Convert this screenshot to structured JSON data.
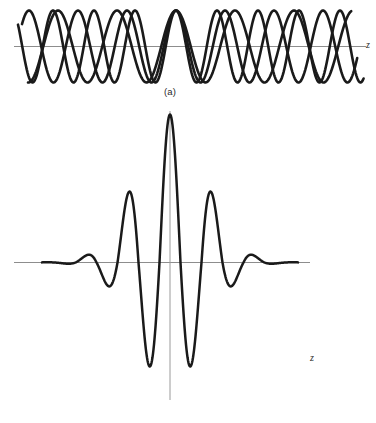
{
  "figure": {
    "background_color": "#ffffff",
    "curve_color": "#1a1a1a",
    "axis_color": "#8d8d8d",
    "width": 376,
    "height": 423
  },
  "panels": [
    {
      "id": "a",
      "caption": "(a)",
      "axis_label": "z",
      "description": "Three superposed sinusoidal waves of slightly different wavelengths that come into phase near the center",
      "axis_y": 46,
      "axis_x_start": 14,
      "axis_x_end": 366
    },
    {
      "id": "b",
      "caption": "(b)",
      "axis_label": "z",
      "description": "Resultant wave packet from the sum of the component waves, peaking where the components are in phase",
      "axis_y": 262,
      "axis_x_start": 14,
      "axis_x_end": 310
    }
  ],
  "chart_data": {
    "type": "line",
    "xlabel": "z",
    "ylabel": "",
    "grid": false,
    "legend": false,
    "panels": [
      {
        "id": "a",
        "caption": "(a)",
        "xlabel": "z",
        "type": "line",
        "xlim": [
          14,
          366
        ],
        "ylim": [
          -1.1,
          1.1
        ],
        "axis_baseline": 0,
        "amplitude_px": 36,
        "phase_center_x": 176,
        "series": [
          {
            "name": "component-wave-1",
            "wavelength_px": 41,
            "amplitude": 1.0,
            "phase_deg": 0
          },
          {
            "name": "component-wave-2",
            "wavelength_px": 49,
            "amplitude": 1.0,
            "phase_deg": 0
          },
          {
            "name": "component-wave-3",
            "wavelength_px": 59,
            "amplitude": 1.0,
            "phase_deg": 0
          }
        ]
      },
      {
        "id": "b",
        "caption": "(b)",
        "xlabel": "z",
        "type": "line",
        "xlim": [
          14,
          310
        ],
        "ylim": [
          -1.05,
          1.05
        ],
        "axis_baseline": 0,
        "carrier_wavelength_px": 42,
        "envelope_sigma_px": 34,
        "center_x": 170,
        "peak_up_px": 148,
        "peak_down_px": 125,
        "extrema": [
          {
            "x": 170,
            "value": 1.0,
            "label": "central-peak"
          },
          {
            "x": 149,
            "value": -0.84,
            "label": "trough-left-1"
          },
          {
            "x": 191,
            "value": -0.84,
            "label": "trough-right-1"
          },
          {
            "x": 128,
            "value": 0.44,
            "label": "peak-left-1"
          },
          {
            "x": 212,
            "value": 0.44,
            "label": "peak-right-1"
          },
          {
            "x": 107,
            "value": -0.3,
            "label": "trough-left-2"
          },
          {
            "x": 233,
            "value": -0.3,
            "label": "trough-right-2"
          },
          {
            "x": 87,
            "value": 0.12,
            "label": "peak-left-2"
          },
          {
            "x": 253,
            "value": 0.12,
            "label": "peak-right-2"
          },
          {
            "x": 66,
            "value": -0.06,
            "label": "trough-left-3"
          },
          {
            "x": 274,
            "value": -0.06,
            "label": "trough-right-3"
          },
          {
            "x": 46,
            "value": 0.02,
            "label": "peak-left-3"
          },
          {
            "x": 294,
            "value": 0.02,
            "label": "peak-right-3"
          }
        ]
      }
    ]
  }
}
